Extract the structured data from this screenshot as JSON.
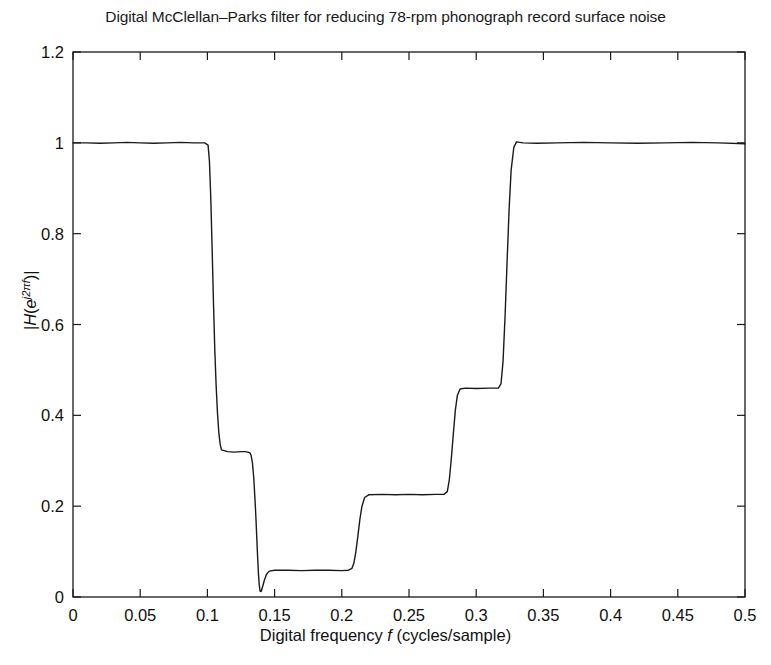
{
  "chart_data": {
    "type": "line",
    "title": "Digital McClellan–Parks filter for reducing 78-rpm phonograph record surface noise",
    "xlabel_plain": "Digital frequency f (cycles/sample)",
    "xlabel_prefix": "Digital frequency ",
    "xlabel_var": "f",
    "xlabel_suffix": " (cycles/sample)",
    "ylabel_plain": "|H(e^j2πf)|",
    "ylabel_open": "|",
    "ylabel_H": "H",
    "ylabel_paren_open": "(",
    "ylabel_e": "e",
    "ylabel_exp": "j2πf",
    "ylabel_paren_close": ")",
    "ylabel_close": "|",
    "xlim": [
      0,
      0.5
    ],
    "ylim": [
      0,
      1.2
    ],
    "xticks": [
      0,
      0.05,
      0.1,
      0.15,
      0.2,
      0.25,
      0.3,
      0.35,
      0.4,
      0.45,
      0.5
    ],
    "xtick_labels": [
      "0",
      "0.05",
      "0.1",
      "0.15",
      "0.2",
      "0.25",
      "0.3",
      "0.35",
      "0.4",
      "0.45",
      "0.5"
    ],
    "yticks": [
      0,
      0.2,
      0.4,
      0.6,
      0.8,
      1,
      1.2
    ],
    "ytick_labels": [
      "0",
      "0.2",
      "0.4",
      "0.6",
      "0.8",
      "1",
      "1.2"
    ],
    "grid": false,
    "legend": false,
    "line_color": "#1a1a1a",
    "line_width": 1.4,
    "background_color": "#ffffff",
    "series": [
      {
        "name": "|H(e^j2πf)|",
        "x": [
          0.0,
          0.01,
          0.02,
          0.03,
          0.04,
          0.05,
          0.06,
          0.07,
          0.08,
          0.09,
          0.098,
          0.1005,
          0.1015,
          0.1025,
          0.1035,
          0.1045,
          0.1055,
          0.1065,
          0.1075,
          0.1085,
          0.1095,
          0.1105,
          0.115,
          0.12,
          0.125,
          0.128,
          0.13,
          0.1315,
          0.1325,
          0.1335,
          0.1345,
          0.1355,
          0.1362,
          0.1368,
          0.1374,
          0.138,
          0.1386,
          0.1392,
          0.14,
          0.141,
          0.1425,
          0.144,
          0.146,
          0.15,
          0.16,
          0.17,
          0.18,
          0.19,
          0.2,
          0.205,
          0.2075,
          0.209,
          0.2105,
          0.212,
          0.2135,
          0.215,
          0.217,
          0.22,
          0.23,
          0.24,
          0.25,
          0.26,
          0.27,
          0.276,
          0.2785,
          0.28,
          0.2815,
          0.283,
          0.2845,
          0.286,
          0.288,
          0.292,
          0.3,
          0.31,
          0.3165,
          0.3185,
          0.32,
          0.3215,
          0.323,
          0.3245,
          0.326,
          0.328,
          0.33,
          0.335,
          0.345,
          0.36,
          0.38,
          0.4,
          0.42,
          0.44,
          0.46,
          0.48,
          0.5
        ],
        "y": [
          1.0,
          1.0,
          0.999,
          1.0,
          1.001,
          1.0,
          0.999,
          1.0,
          1.001,
          1.0,
          1.0,
          0.995,
          0.96,
          0.88,
          0.77,
          0.65,
          0.545,
          0.465,
          0.405,
          0.362,
          0.336,
          0.324,
          0.32,
          0.319,
          0.32,
          0.32,
          0.319,
          0.318,
          0.312,
          0.296,
          0.262,
          0.21,
          0.168,
          0.126,
          0.086,
          0.05,
          0.026,
          0.013,
          0.012,
          0.022,
          0.038,
          0.05,
          0.057,
          0.059,
          0.059,
          0.058,
          0.059,
          0.059,
          0.058,
          0.059,
          0.063,
          0.075,
          0.1,
          0.135,
          0.172,
          0.2,
          0.219,
          0.225,
          0.226,
          0.225,
          0.226,
          0.225,
          0.226,
          0.226,
          0.232,
          0.258,
          0.305,
          0.36,
          0.412,
          0.444,
          0.458,
          0.46,
          0.459,
          0.46,
          0.46,
          0.47,
          0.52,
          0.62,
          0.74,
          0.855,
          0.94,
          0.99,
          1.002,
          1.0,
          0.999,
          1.0,
          1.001,
          1.0,
          0.999,
          1.0,
          1.001,
          1.0,
          0.998
        ]
      }
    ],
    "annotations": {
      "passband_low_edge": 0.101,
      "first_shelf_level": 0.32,
      "notch_frequency": 0.1392,
      "notch_depth": 0.012,
      "stopband_level": 0.059,
      "second_shelf_level": 0.225,
      "third_shelf_level": 0.46,
      "passband_high_edge": 0.328,
      "passband_level": 1.0
    }
  },
  "plot_geometry": {
    "left": 73,
    "right": 745,
    "top": 52,
    "bottom": 597
  }
}
